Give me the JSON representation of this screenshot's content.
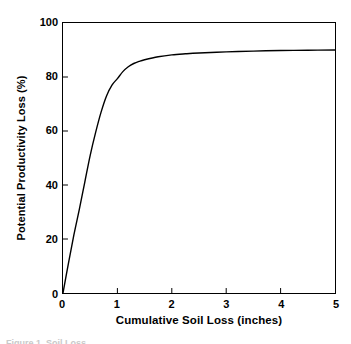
{
  "figure": {
    "caption_clipped": "Figure 1. Soil Loss",
    "background_color": "#ffffff",
    "line_color": "#000000"
  },
  "chart_data": {
    "type": "line",
    "title": "",
    "xlabel": "Cumulative Soil Loss (inches)",
    "ylabel": "Potential Productivity Loss (%)",
    "xlim": [
      0,
      5
    ],
    "ylim": [
      0,
      100
    ],
    "xticks": [
      0,
      1,
      2,
      3,
      4,
      5
    ],
    "xtick_labels": [
      "0",
      "1",
      "2",
      "3",
      "4",
      "5"
    ],
    "yticks": [
      0,
      20,
      40,
      60,
      80,
      100
    ],
    "ytick_labels": [
      "0",
      "20",
      "40",
      "60",
      "80",
      "100"
    ],
    "grid": false,
    "legend": null,
    "series": [
      {
        "name": "Potential Productivity Loss",
        "color": "#000000",
        "x": [
          0.0,
          0.1,
          0.2,
          0.3,
          0.4,
          0.5,
          0.6,
          0.7,
          0.8,
          0.9,
          1.0,
          1.1,
          1.2,
          1.3,
          1.4,
          1.5,
          1.75,
          2.0,
          2.25,
          2.5,
          3.0,
          3.5,
          4.0,
          4.5,
          5.0
        ],
        "y": [
          0.0,
          11.0,
          21.5,
          31.0,
          41.0,
          51.0,
          59.5,
          67.0,
          73.0,
          77.0,
          79.4,
          82.0,
          83.8,
          85.0,
          85.8,
          86.4,
          87.5,
          88.2,
          88.6,
          88.9,
          89.3,
          89.6,
          89.8,
          89.9,
          90.0
        ]
      }
    ]
  }
}
